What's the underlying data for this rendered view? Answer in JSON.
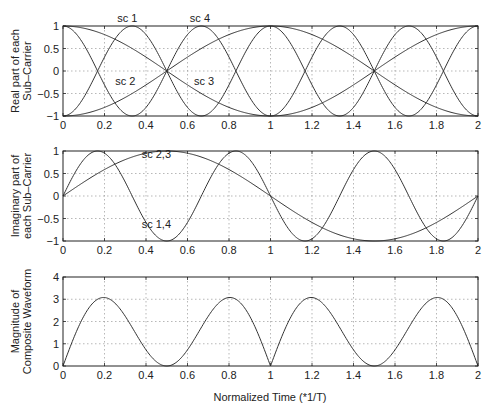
{
  "chart_data": [
    {
      "type": "line",
      "title": "",
      "xlabel": "",
      "ylabel": "Real part of each Sub-Carrier",
      "ylabel_lines": [
        "Real part of each",
        "Sub–Carrier"
      ],
      "xlim": [
        0,
        2
      ],
      "ylim": [
        -1,
        1
      ],
      "grid": true,
      "xticks": [
        "0",
        "0.2",
        "0.4",
        "0.6",
        "0.8",
        "1",
        "1.2",
        "1.4",
        "1.6",
        "1.8",
        "2"
      ],
      "yticks": [
        "1",
        "0.5",
        "0",
        "−0.5",
        "−1"
      ],
      "series": [
        {
          "name": "sc 1",
          "expr": "-cos(3*pi*t)",
          "x": [
            0,
            0.333,
            0.5,
            0.667,
            1,
            1.333,
            1.5,
            1.667,
            2
          ],
          "values": [
            -1,
            1,
            0,
            -1,
            1,
            -1,
            0,
            1,
            -1
          ]
        },
        {
          "name": "sc 2",
          "expr": "-cos(pi*t)",
          "x": [
            0,
            0.5,
            1,
            1.5,
            2
          ],
          "values": [
            -1,
            0,
            1,
            0,
            -1
          ]
        },
        {
          "name": "sc 3",
          "expr": "cos(pi*t)",
          "x": [
            0,
            0.5,
            1,
            1.5,
            2
          ],
          "values": [
            1,
            0,
            -1,
            0,
            1
          ]
        },
        {
          "name": "sc 4",
          "expr": "cos(3*pi*t)",
          "x": [
            0,
            0.333,
            0.5,
            0.667,
            1,
            1.333,
            1.5,
            1.667,
            2
          ],
          "values": [
            1,
            -1,
            0,
            1,
            -1,
            1,
            0,
            -1,
            1
          ]
        }
      ],
      "annotations": [
        {
          "text": "sc 1",
          "x": 0.31,
          "y": 1.08
        },
        {
          "text": "sc 4",
          "x": 0.66,
          "y": 1.08
        },
        {
          "text": "sc 2",
          "x": 0.3,
          "y": -0.3
        },
        {
          "text": "sc 3",
          "x": 0.68,
          "y": -0.3
        }
      ]
    },
    {
      "type": "line",
      "title": "",
      "xlabel": "",
      "ylabel": "Imaginary part of each Sub-Carrier",
      "ylabel_lines": [
        "Imaginary part of",
        "each Sub–Carrier"
      ],
      "xlim": [
        0,
        2
      ],
      "ylim": [
        -1,
        1
      ],
      "grid": true,
      "xticks": [
        "0",
        "0.2",
        "0.4",
        "0.6",
        "0.8",
        "1",
        "1.2",
        "1.4",
        "1.6",
        "1.8",
        "2"
      ],
      "yticks": [
        "1",
        "0.5",
        "0",
        "−0.5",
        "−1"
      ],
      "series": [
        {
          "name": "sc 1,4",
          "expr": "sin(3*pi*t)",
          "x": [
            0,
            0.167,
            0.333,
            0.5,
            0.667,
            0.833,
            1,
            1.167,
            1.333,
            1.5,
            1.667,
            1.833,
            2
          ],
          "values": [
            0,
            1,
            0,
            -1,
            0,
            1,
            0,
            -1,
            0,
            1,
            0,
            -1,
            0
          ]
        },
        {
          "name": "sc 2,3",
          "expr": "sin(pi*t)",
          "x": [
            0,
            0.5,
            1,
            1.5,
            2
          ],
          "values": [
            0,
            1,
            0,
            -1,
            0
          ]
        }
      ],
      "annotations": [
        {
          "text": "sc 2,3",
          "x": 0.45,
          "y": 0.85
        },
        {
          "text": "sc 1,4",
          "x": 0.45,
          "y": -0.7
        }
      ]
    },
    {
      "type": "line",
      "title": "",
      "xlabel": "Normalized Time (*1/T)",
      "ylabel": "Magnitude of Composite Waveform",
      "ylabel_lines": [
        "Magnitude of",
        "Composite Waveform"
      ],
      "xlim": [
        0,
        2
      ],
      "ylim": [
        0,
        4
      ],
      "grid": true,
      "xticks": [
        "0",
        "0.2",
        "0.4",
        "0.6",
        "0.8",
        "1",
        "1.2",
        "1.4",
        "1.6",
        "1.8",
        "2"
      ],
      "yticks": [
        "4",
        "3",
        "2",
        "1",
        "0"
      ],
      "series": [
        {
          "name": "composite magnitude",
          "expr": "|2*(sin(3*pi*t)+sin(pi*t))|",
          "x": [
            0,
            0.2,
            0.5,
            0.8,
            1,
            1.2,
            1.5,
            1.8,
            2
          ],
          "values": [
            0,
            3.08,
            0,
            3.08,
            0,
            3.08,
            0,
            3.08,
            0
          ]
        }
      ]
    }
  ],
  "layout": {
    "x_px": [
      63,
      478
    ],
    "panels": [
      {
        "top": 26,
        "bottom": 116
      },
      {
        "top": 151,
        "bottom": 241
      },
      {
        "top": 277,
        "bottom": 366
      }
    ],
    "line_color": "#333333",
    "grid_color": "#9a9a9a"
  }
}
